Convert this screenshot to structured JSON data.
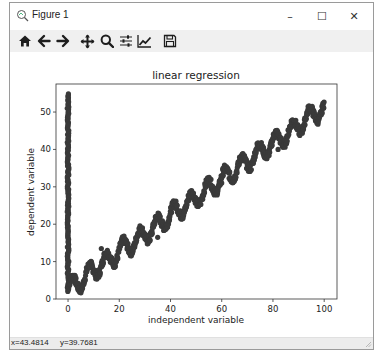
{
  "window": {
    "title": "Figure 1",
    "controls": {
      "minimize": "–",
      "maximize": "☐",
      "close": "✕"
    }
  },
  "toolbar": {
    "buttons": [
      {
        "name": "home",
        "icon": "home-icon"
      },
      {
        "name": "back",
        "icon": "arrow-left-icon"
      },
      {
        "name": "forward",
        "icon": "arrow-right-icon"
      },
      {
        "name": "pan",
        "icon": "move-icon"
      },
      {
        "name": "zoom",
        "icon": "magnifier-icon"
      },
      {
        "name": "subplots",
        "icon": "sliders-icon"
      },
      {
        "name": "edit-axis",
        "icon": "line-chart-icon"
      },
      {
        "name": "save",
        "icon": "floppy-disk-icon"
      }
    ]
  },
  "statusbar": {
    "x_readout": "x=43.4814",
    "y_readout": "y=39.7681"
  },
  "chart_data": {
    "type": "scatter",
    "title": "linear regression",
    "xlabel": "independent variable",
    "ylabel": "dependent variable",
    "xlim": [
      -4.7,
      105
    ],
    "ylim": [
      0,
      57.5
    ],
    "xticks": [
      0,
      20,
      40,
      60,
      80,
      100
    ],
    "yticks": [
      0,
      10,
      20,
      30,
      40,
      50
    ],
    "grid": false,
    "legend": null,
    "marker_color": "#3a3a3a",
    "series": [
      {
        "name": "vertical cluster at x=0",
        "x_value": 0,
        "y_range": [
          2,
          55
        ]
      },
      {
        "name": "oscillating linear trend",
        "description": "y ≈ 0.48x + 3 + 2.5·sin(x), x from 0 to 100",
        "x": [
          0,
          5,
          10,
          15,
          20,
          25,
          30,
          35,
          40,
          45,
          50,
          55,
          60,
          65,
          70,
          75,
          80,
          85,
          90,
          95,
          100
        ],
        "y": [
          3,
          4,
          8,
          10,
          13,
          15,
          17,
          20,
          23,
          25,
          27,
          30,
          32,
          35,
          37,
          40,
          42,
          44,
          47,
          50,
          51
        ]
      }
    ],
    "outliers": [
      [
        13,
        13.5
      ],
      [
        35,
        16.5
      ],
      [
        60,
        31
      ],
      [
        82,
        40
      ]
    ]
  }
}
